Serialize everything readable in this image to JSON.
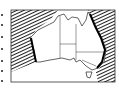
{
  "map": {
    "subject": "Australia",
    "style": "black-and-white line map",
    "features": [
      "state borders",
      "hatched ocean regions west and east",
      "bold coastline segments on west and east coasts",
      "Tasmania"
    ],
    "colors": {
      "ink": "#111111",
      "background": "#ffffff",
      "hatch": "#222222"
    }
  }
}
